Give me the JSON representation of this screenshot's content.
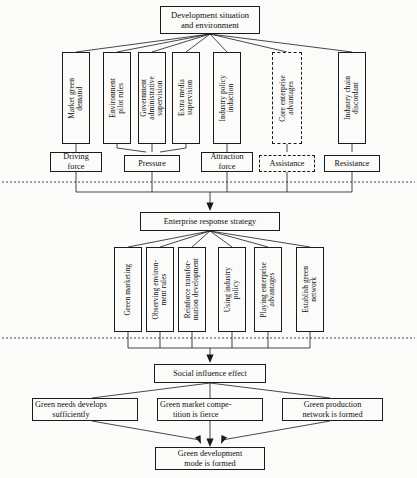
{
  "diagram": {
    "title": "Development situation and environment",
    "header": {
      "label": "Development situation\nand environment"
    },
    "drivers": [
      {
        "label": "Market green\ndemand",
        "style": "solid"
      },
      {
        "label": "Environment\npilot rules",
        "style": "solid"
      },
      {
        "label": "Government\nadministrative\nsupervision",
        "style": "solid"
      },
      {
        "label": "Extra media\nsupervision",
        "style": "solid"
      },
      {
        "label": "Industry policy\ninduction",
        "style": "solid"
      },
      {
        "label": "Core enterprise\nadvantages",
        "style": "dashed"
      },
      {
        "label": "Industry chain\ndiscordant",
        "style": "solid"
      }
    ],
    "forces": [
      {
        "label": "Driving\nforce",
        "style": "solid"
      },
      {
        "label": "Pressure",
        "style": "solid"
      },
      {
        "label": "Attraction\nforce",
        "style": "solid"
      },
      {
        "label": "Assistance",
        "style": "dashed"
      },
      {
        "label": "Resistance",
        "style": "solid"
      }
    ],
    "strategy": {
      "label": "Enterprise response strategy"
    },
    "actions": [
      {
        "label": "Green marketing"
      },
      {
        "label": "Observing environ-\nment rules"
      },
      {
        "label": "Reinforce transfor-\nmation development"
      },
      {
        "label": "Using industry\npolicy"
      },
      {
        "label": "Playing enterprise\nadvantages"
      },
      {
        "label": "Establish green\nnetwork"
      }
    ],
    "effect": {
      "label": "Social influence effect"
    },
    "outcomes": [
      {
        "label": "Green needs develops\nsufficiently"
      },
      {
        "label": "Green market compe-\ntition is fierce"
      },
      {
        "label": "Green production\nnetwork is formed"
      }
    ],
    "conclusion": {
      "label": "Green development\nmode is formed"
    },
    "colors": {
      "line": "#1b1b1b",
      "text": "#101010",
      "background": "#fbfbfa"
    }
  }
}
